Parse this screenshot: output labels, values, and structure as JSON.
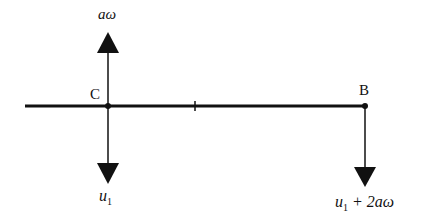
{
  "diagram": {
    "type": "velocity diagram of a rod",
    "rod": {
      "x1": 25,
      "x2": 365,
      "y": 106,
      "color": "#111111"
    },
    "points": [
      {
        "name": "C",
        "label": "C",
        "x": 108
      },
      {
        "name": "midpoint-tick",
        "label": "",
        "x": 195
      },
      {
        "name": "B",
        "label": "B",
        "x": 365
      }
    ],
    "arrows": [
      {
        "at": "C",
        "direction": "up",
        "label_main": "aω"
      },
      {
        "at": "C",
        "direction": "down",
        "label_main": "u",
        "label_sub": "1"
      },
      {
        "at": "B",
        "direction": "down",
        "label_main": "u",
        "label_sub": "1",
        "label_rest": " + 2aω"
      }
    ]
  },
  "labels": {
    "c": "C",
    "b": "B",
    "c_up": "aω",
    "c_down_main": "u",
    "c_down_sub": "1",
    "b_down_main": "u",
    "b_down_sub": "1",
    "b_down_rest": " + 2aω"
  }
}
